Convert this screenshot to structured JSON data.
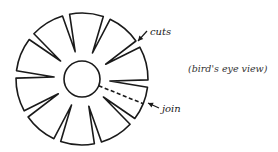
{
  "diagram": {
    "title": "",
    "labels": {
      "cuts": "cuts",
      "join": "join",
      "view": "(bird's eye view)"
    },
    "shape": {
      "center": [
        82,
        79
      ],
      "outer_radius": 66,
      "inner_radius": 18,
      "cut_count": 10,
      "stroke_color": "#1a1a1a",
      "background": "#ffffff"
    },
    "elements": [
      {
        "id": "outer-rim",
        "type": "circle-arc",
        "description": "outer circular rim divided into segments by V-shaped cuts"
      },
      {
        "id": "inner-circle",
        "type": "circle",
        "description": "central circular hole"
      },
      {
        "id": "cuts",
        "type": "v-notches",
        "count": 10,
        "description": "wedge-shaped cuts from rim toward center"
      },
      {
        "id": "join",
        "type": "dashed-line",
        "description": "dashed radial line from inner circle to rim marking the join"
      },
      {
        "id": "cuts-arrow",
        "type": "arrow",
        "points_to": "cut at upper right"
      },
      {
        "id": "join-arrow",
        "type": "arrow",
        "points_to": "join at rim"
      }
    ]
  }
}
